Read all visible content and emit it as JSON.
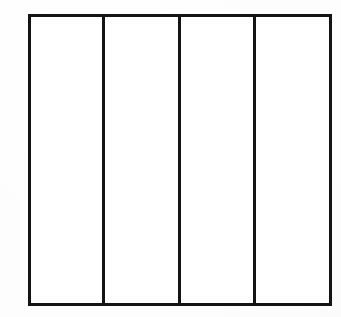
{
  "document": {
    "title": "Four-Panel Rectangle Diagram",
    "description": "A plain black-outlined rectangle divided by three vertical lines into four tall vertical panels, drawn on white paper.",
    "background_color": "#ffffff",
    "ink_color": "#141414"
  },
  "figure": {
    "name": "divided-rectangle",
    "shape": "rectangle",
    "outer_border": {
      "x": 28,
      "y": 14,
      "width": 304,
      "height": 292,
      "stroke_width": 3,
      "stroke_color": "#141414",
      "fill_color": "#ffffff"
    },
    "dividers": [
      {
        "label": "divider-1",
        "x": 103,
        "stroke_width": 3
      },
      {
        "label": "divider-2",
        "x": 179,
        "stroke_width": 3
      },
      {
        "label": "divider-3",
        "x": 254,
        "stroke_width": 3
      }
    ],
    "panels": [
      {
        "label": "panel-1",
        "x": 30,
        "width": 72,
        "text": ""
      },
      {
        "label": "panel-2",
        "x": 105,
        "width": 73,
        "text": ""
      },
      {
        "label": "panel-3",
        "x": 181,
        "width": 72,
        "text": ""
      },
      {
        "label": "panel-4",
        "x": 256,
        "width": 74,
        "text": ""
      }
    ],
    "panel_count": 4
  },
  "canvas": {
    "width": 341,
    "height": 317
  }
}
